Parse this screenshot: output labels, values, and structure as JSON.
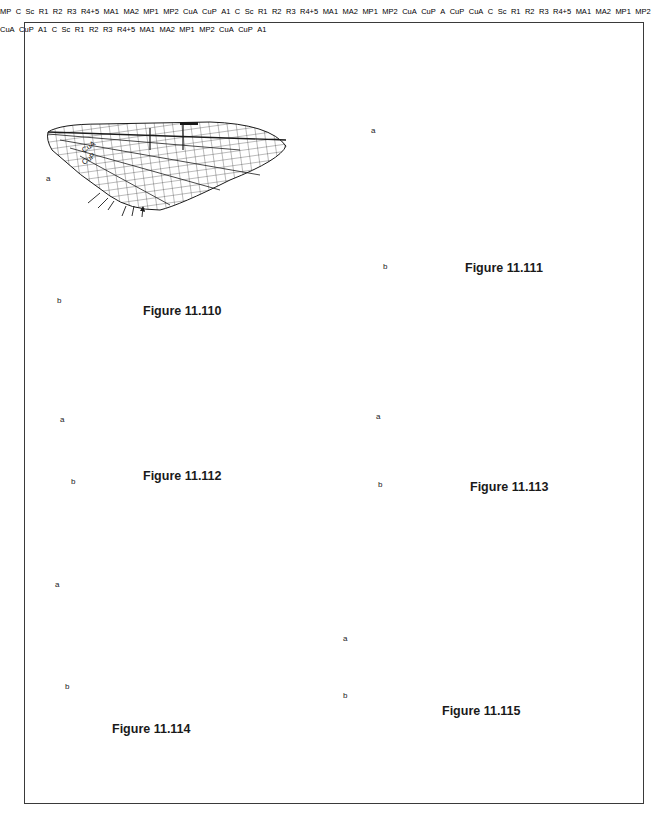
{
  "figures": [
    {
      "id": "11.110",
      "caption": "Figure 11.110",
      "panels": [
        {
          "label": "a",
          "vein_labels": [
            "CuA",
            "CuP"
          ],
          "arrows": 6
        },
        {
          "label": "b",
          "vein_labels": [
            "MP"
          ],
          "arrows": 0
        }
      ]
    },
    {
      "id": "11.111",
      "caption": "Figure 11.111",
      "panels": [
        {
          "label": "a",
          "vein_labels": [
            "C",
            "Sc",
            "R1",
            "R2",
            "R3",
            "R4+5",
            "MA1",
            "MA2",
            "MP1",
            "MP2",
            "CuA",
            "CuP",
            "A1"
          ],
          "arrows": 2
        },
        {
          "label": "b",
          "vein_labels": [],
          "arrows": 0
        }
      ]
    },
    {
      "id": "11.112",
      "caption": "Figure 11.112",
      "panels": [
        {
          "label": "a",
          "vein_labels": [
            "C",
            "Sc",
            "R1",
            "R2",
            "R3",
            "R4+5",
            "MA1",
            "MA2",
            "MP1",
            "MP2",
            "CuA",
            "CuP",
            "A"
          ],
          "arrows": 4
        },
        {
          "label": "b",
          "vein_labels": [],
          "arrows": 0
        }
      ]
    },
    {
      "id": "11.113",
      "caption": "Figure 11.113",
      "panels": [
        {
          "label": "a",
          "vein_labels": [
            "CuP",
            "CuA"
          ],
          "arrows": 4
        },
        {
          "label": "b",
          "vein_labels": [],
          "arrows": 0
        }
      ]
    },
    {
      "id": "11.114",
      "caption": "Figure 11.114",
      "panels": [
        {
          "label": "a",
          "vein_labels": [
            "C",
            "Sc",
            "R1",
            "R2",
            "R3",
            "R4+5",
            "MA1",
            "MA2",
            "MP1",
            "MP2",
            "CuA",
            "CuP",
            "A1"
          ],
          "arrows": 1
        },
        {
          "label": "b",
          "vein_labels": [],
          "arrows": 3
        }
      ]
    },
    {
      "id": "11.115",
      "caption": "Figure 11.115",
      "panels": [
        {
          "label": "a",
          "vein_labels": [
            "C",
            "Sc",
            "R1",
            "R2",
            "R3",
            "R4+5",
            "MA1",
            "MA2",
            "MP1",
            "MP2",
            "CuA",
            "CuP",
            "A1"
          ],
          "arrows": 5
        },
        {
          "label": "b",
          "vein_labels": [],
          "arrows": 0
        }
      ]
    }
  ],
  "labels": {
    "a": "a",
    "b": "b",
    "C": "C",
    "Sc": "Sc",
    "R1": "R",
    "R2": "R",
    "R3": "R",
    "R45": "R",
    "MA": "MA",
    "MP": "MP",
    "CuA": "CuA",
    "CuP": "CuP",
    "A": "A",
    "sub1": "1",
    "sub2": "2",
    "sub3": "3",
    "sub45": "4+5"
  },
  "colors": {
    "ink": "#1a1a1a",
    "frame": "#3a3a3a",
    "background": "#ffffff"
  }
}
